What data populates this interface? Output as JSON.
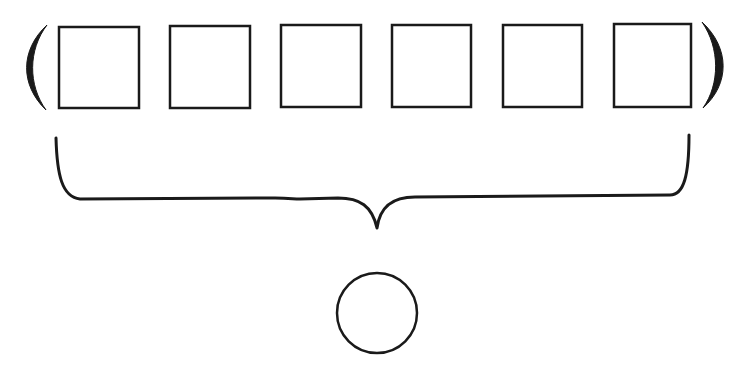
{
  "diagram": {
    "stroke_color": "#1a1a1a",
    "background": "#ffffff",
    "boxes": [
      {
        "x": 59,
        "y": 27,
        "w": 80,
        "h": 81
      },
      {
        "x": 170,
        "y": 26,
        "w": 80,
        "h": 82
      },
      {
        "x": 281,
        "y": 25,
        "w": 80,
        "h": 82
      },
      {
        "x": 392,
        "y": 25,
        "w": 79,
        "h": 82
      },
      {
        "x": 503,
        "y": 25,
        "w": 79,
        "h": 82
      },
      {
        "x": 614,
        "y": 24,
        "w": 77,
        "h": 83
      }
    ],
    "circle": {
      "cx": 377,
      "cy": 313,
      "r": 40
    }
  }
}
